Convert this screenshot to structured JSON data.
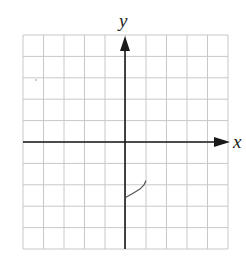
{
  "chart_data": {
    "type": "line",
    "title": "",
    "xlabel": "x",
    "ylabel": "y",
    "xlim": [
      -5,
      5
    ],
    "ylim": [
      -5,
      5
    ],
    "grid": true,
    "grid_cells": {
      "columns": 10,
      "rows": 10
    },
    "series": [
      {
        "name": "curve",
        "points": [
          [
            0,
            -2.6
          ],
          [
            0.35,
            -2.4
          ],
          [
            0.7,
            -2.2
          ],
          [
            0.9,
            -2.0
          ],
          [
            1.0,
            -1.8
          ]
        ]
      }
    ],
    "colors": {
      "grid": "#c8c8c8",
      "axis": "#1a1a1a",
      "curve": "#555555"
    }
  },
  "labels": {
    "x_axis": "x",
    "y_axis": "y"
  }
}
